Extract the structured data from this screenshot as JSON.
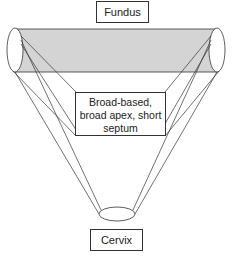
{
  "diagram": {
    "top_label": "Fundus",
    "middle_label_lines": [
      "Broad-based,",
      "broad apex, short",
      "septum"
    ],
    "bottom_label": "Cervix",
    "colors": {
      "band_fill": "#d4d4d4",
      "stroke": "#333333",
      "background": "#ffffff"
    }
  }
}
